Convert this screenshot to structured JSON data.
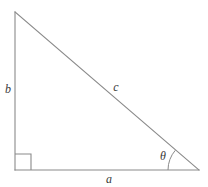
{
  "figure": {
    "background_color": "#ffffff",
    "stroke_color": "#8a8a8a",
    "label_color": "#3a3a3a",
    "stroke_width": 1.1,
    "vertices": {
      "top": {
        "x": 15,
        "y": 12
      },
      "bottom_left": {
        "x": 15,
        "y": 170
      },
      "bottom_right": {
        "x": 199,
        "y": 170
      }
    },
    "right_angle_marker": {
      "x": 15,
      "y": 154,
      "size": 16
    },
    "angle_arc": {
      "center_x": 199,
      "center_y": 170,
      "radius": 31
    },
    "labels": {
      "side_a": {
        "text": "a",
        "x": 109,
        "y": 180
      },
      "side_b": {
        "text": "b",
        "x": 8,
        "y": 90
      },
      "side_c": {
        "text": "c",
        "x": 116,
        "y": 88
      },
      "angle_theta": {
        "text": "θ",
        "x": 163,
        "y": 157
      }
    }
  }
}
